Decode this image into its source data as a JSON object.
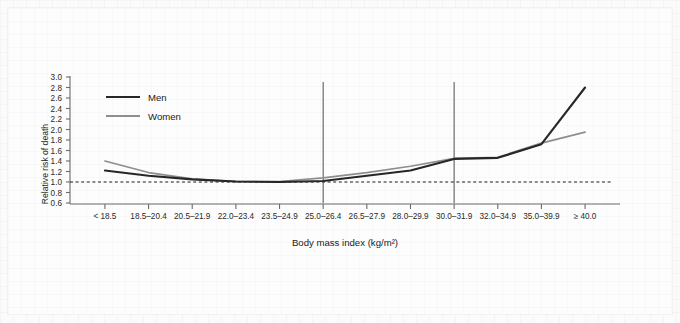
{
  "figure": {
    "background_color": "#fbfbfb",
    "card_color": "#fdfdfd"
  },
  "chart_data": {
    "type": "line",
    "title": "",
    "xlabel": "Body mass index (kg/m²)",
    "ylabel": "Relative risk of death",
    "categories": [
      "< 18.5",
      "18.5–20.4",
      "20.5–21.9",
      "22.0–23.4",
      "23.5–24.9",
      "25.0–26.4",
      "26.5–27.9",
      "28.0–29.9",
      "30.0–31.9",
      "32.0–34.9",
      "35.0–39.9",
      "≥ 40.0"
    ],
    "series": [
      {
        "name": "Men",
        "color": "#272727",
        "values": [
          1.22,
          1.12,
          1.05,
          1.01,
          1.0,
          1.02,
          1.12,
          1.22,
          1.44,
          1.46,
          1.72,
          2.8
        ]
      },
      {
        "name": "Women",
        "color": "#8e8e8e",
        "values": [
          1.4,
          1.18,
          1.06,
          1.01,
          1.01,
          1.08,
          1.18,
          1.3,
          1.45,
          1.47,
          1.74,
          1.95
        ]
      }
    ],
    "ylim": [
      0.6,
      3.0
    ],
    "ytick_step": 0.2,
    "yticks": [
      "3.0",
      "2.8",
      "2.6",
      "2.4",
      "2.2",
      "2.0",
      "1.8",
      "1.6",
      "1.4",
      "1.2",
      "1.0",
      "0.8",
      "0.6"
    ],
    "grid": false,
    "legend_position": "top-left",
    "annotations": {
      "reference_line_y": {
        "value": 1.0,
        "style": "dashed",
        "color": "#1a1a1a"
      },
      "reference_lines_x": [
        {
          "category": "25.0–26.4",
          "color": "#5c5c5c"
        },
        {
          "category": "30.0–31.9",
          "color": "#5c5c5c"
        }
      ]
    }
  },
  "legend": {
    "items": [
      {
        "label": "Men",
        "color": "#272727"
      },
      {
        "label": "Women",
        "color": "#8e8e8e"
      }
    ]
  }
}
